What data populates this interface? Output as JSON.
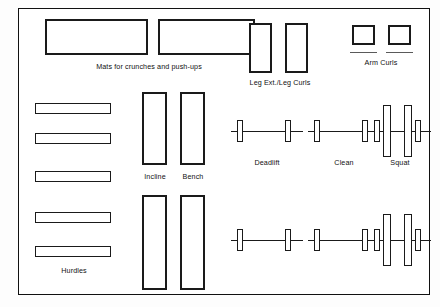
{
  "diagram": {
    "background": "#ffffff",
    "line_color": "#1a1a1a"
  },
  "labels": {
    "mats": "Mats for crunches and push-ups",
    "leg_ext": "Leg Ext./Leg Curls",
    "arm_curls": "Arm Curls",
    "hurdles": "Hurdles",
    "incline": "Incline",
    "bench": "Bench",
    "deadlift": "Deadlift",
    "clean": "Clean",
    "squat": "Squat"
  },
  "stations": [
    {
      "name": "mat-1",
      "type": "rectangle",
      "group": "mats"
    },
    {
      "name": "mat-2",
      "type": "rectangle",
      "group": "mats"
    },
    {
      "name": "leg-machine-1",
      "type": "rectangle",
      "group": "leg_ext"
    },
    {
      "name": "leg-machine-2",
      "type": "rectangle",
      "group": "leg_ext"
    },
    {
      "name": "arm-curl-station-1",
      "type": "square",
      "group": "arm_curls"
    },
    {
      "name": "arm-curl-station-2",
      "type": "square",
      "group": "arm_curls"
    },
    {
      "name": "hurdle-1",
      "type": "bar",
      "group": "hurdles"
    },
    {
      "name": "hurdle-2",
      "type": "bar",
      "group": "hurdles"
    },
    {
      "name": "hurdle-3",
      "type": "bar",
      "group": "hurdles"
    },
    {
      "name": "hurdle-4",
      "type": "bar",
      "group": "hurdles"
    },
    {
      "name": "hurdle-5",
      "type": "bar",
      "group": "hurdles"
    },
    {
      "name": "incline-bench-upper",
      "type": "rectangle",
      "group": "incline"
    },
    {
      "name": "flat-bench-upper",
      "type": "rectangle",
      "group": "bench"
    },
    {
      "name": "incline-bench-lower",
      "type": "rectangle",
      "group": "incline"
    },
    {
      "name": "flat-bench-lower",
      "type": "rectangle",
      "group": "bench"
    },
    {
      "name": "barbell-deadlift-upper",
      "type": "barbell",
      "group": "deadlift"
    },
    {
      "name": "barbell-clean-upper",
      "type": "barbell",
      "group": "clean"
    },
    {
      "name": "barbell-deadlift-lower",
      "type": "barbell",
      "group": "deadlift"
    },
    {
      "name": "barbell-clean-lower",
      "type": "barbell",
      "group": "clean"
    },
    {
      "name": "squat-rack-upper",
      "type": "rack",
      "group": "squat"
    },
    {
      "name": "squat-rack-lower",
      "type": "rack",
      "group": "squat"
    }
  ],
  "counts": {
    "mats": 2,
    "leg_machines": 2,
    "arm_curl_stations": 2,
    "hurdles": 5,
    "benches": 4,
    "barbells": 4,
    "squat_racks": 2
  }
}
